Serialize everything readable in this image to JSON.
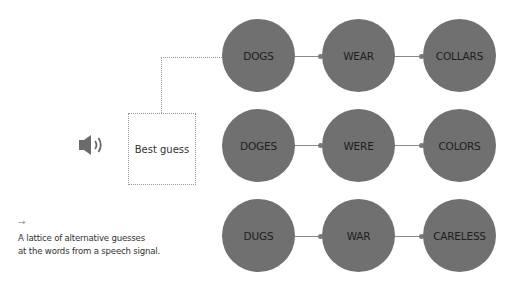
{
  "diagram": {
    "speaker_icon": "speaker-icon",
    "best_guess_label": "Best guess",
    "caption_arrow": "→",
    "caption_lines": [
      "A lattice of alternative guesses",
      "at the words from a speech signal."
    ],
    "rows": [
      {
        "words": [
          "DOGS",
          "WEAR",
          "COLLARS"
        ],
        "best": true
      },
      {
        "words": [
          "DOGES",
          "WERE",
          "COLORS"
        ],
        "best": false
      },
      {
        "words": [
          "DUGS",
          "WAR",
          "CARELESS"
        ],
        "best": false
      }
    ],
    "colors": {
      "node_fill": "#707070",
      "node_text": "#1e1e1e",
      "edge": "#8a8a8a",
      "dotted": "#9a9a9a"
    }
  }
}
